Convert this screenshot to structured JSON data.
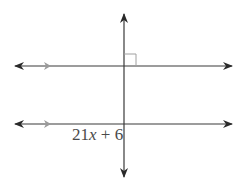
{
  "diagram": {
    "angle_label": {
      "base": "21",
      "variable": "x",
      "rest": " + 6"
    },
    "colors": {
      "line": "#3a3a3a",
      "parallel_marker": "#9a9a9a",
      "right_angle_mark": "#a0a0a0",
      "label": "#4a4a4a"
    },
    "lines": [
      {
        "name": "upper-parallel-line",
        "y": 66,
        "x1": 15,
        "x2": 232
      },
      {
        "name": "lower-parallel-line",
        "y": 124,
        "x1": 15,
        "x2": 232
      },
      {
        "name": "transversal",
        "x": 124,
        "y1": 14,
        "y2": 177
      }
    ],
    "right_angle": {
      "x": 124,
      "y": 66,
      "size": 12
    }
  }
}
